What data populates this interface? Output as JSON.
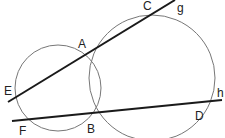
{
  "diagram": {
    "circles": [
      {
        "name": "small-circle",
        "cx": 58,
        "cy": 88,
        "r": 43
      },
      {
        "name": "large-circle",
        "cx": 152,
        "cy": 78,
        "r": 63
      }
    ],
    "lines": [
      {
        "name": "line-g",
        "x1": 8,
        "y1": 102,
        "x2": 175,
        "y2": 0
      },
      {
        "name": "line-h",
        "x1": 12,
        "y1": 121,
        "x2": 222,
        "y2": 100
      }
    ],
    "labels": {
      "A": "A",
      "B": "B",
      "C": "C",
      "D": "D",
      "E": "E",
      "F": "F",
      "g": "g",
      "h": "h"
    },
    "colors": {
      "circle": "#777777",
      "line": "#1a1a1a"
    }
  }
}
